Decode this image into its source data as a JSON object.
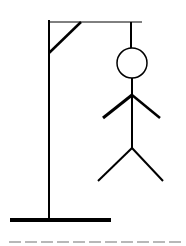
{
  "game": {
    "type": "hangman",
    "colors": {
      "stroke": "#000000",
      "background": "#ffffff",
      "slot": "#9a9a9a"
    },
    "gallows": {
      "base": {
        "x1": 10,
        "y1": 220,
        "x2": 111,
        "y2": 220,
        "width": 4
      },
      "post": {
        "x1": 49,
        "y1": 20,
        "x2": 49,
        "y2": 220,
        "width": 2
      },
      "beam": {
        "x1": 48,
        "y1": 22,
        "x2": 142,
        "y2": 22,
        "width": 1
      },
      "brace": {
        "x1": 49,
        "y1": 53,
        "x2": 81,
        "y2": 22,
        "width": 2.5
      },
      "rope": {
        "x1": 131,
        "y1": 22,
        "x2": 131,
        "y2": 48,
        "width": 2
      }
    },
    "figure": {
      "head": {
        "cx": 132,
        "cy": 63,
        "r": 15,
        "width": 1.5
      },
      "body": {
        "x1": 132,
        "y1": 78,
        "x2": 132,
        "y2": 149,
        "width": 2
      },
      "left_arm": {
        "x1": 132,
        "y1": 95,
        "x2": 103,
        "y2": 118,
        "width": 3
      },
      "right_arm": {
        "x1": 132,
        "y1": 95,
        "x2": 160,
        "y2": 118,
        "width": 2.5
      },
      "left_leg": {
        "x1": 132,
        "y1": 148,
        "x2": 98,
        "y2": 181,
        "width": 2
      },
      "right_leg": {
        "x1": 132,
        "y1": 148,
        "x2": 163,
        "y2": 181,
        "width": 2
      }
    },
    "parts_shown": [
      "head",
      "body",
      "left_arm",
      "right_arm",
      "left_leg",
      "right_leg"
    ],
    "word": {
      "slots": [
        "",
        "",
        "",
        "",
        "",
        "",
        "",
        "",
        "",
        "",
        ""
      ]
    }
  }
}
